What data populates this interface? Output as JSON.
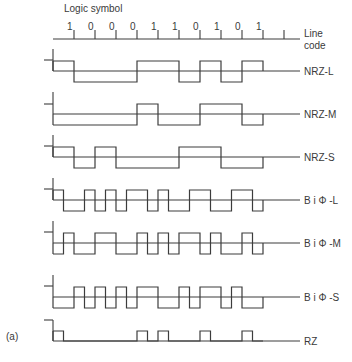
{
  "figure": {
    "header_label": "Logic symbol",
    "axis_label_line1": "Line",
    "axis_label_line2": "code",
    "panel_label": "(a)",
    "stroke_color": "#3c3c3c",
    "text_color": "#3a3a3a",
    "bits": [
      "1",
      "0",
      "0",
      "0",
      "1",
      "1",
      "0",
      "1",
      "0",
      "1"
    ],
    "x_start": 53,
    "bit_width": 21,
    "extra_tick": true
  },
  "waveforms": [
    {
      "name": "NRZ-L",
      "label": "NRZ-L",
      "base_y": 71,
      "high_y": 61,
      "low_y": 82,
      "axis_top": 49,
      "ref_tick_y": 60,
      "levels": [
        "H",
        "H",
        "L",
        "L",
        "L",
        "L",
        "L",
        "L",
        "H",
        "H",
        "H",
        "H",
        "L",
        "L",
        "H",
        "H",
        "L",
        "L",
        "H",
        "H"
      ]
    },
    {
      "name": "NRZ-M",
      "label": "NRZ-M",
      "base_y": 114,
      "high_y": 104,
      "low_y": 125,
      "axis_top": 92,
      "ref_tick_y": 104,
      "levels": [
        "L",
        "L",
        "L",
        "L",
        "L",
        "L",
        "L",
        "L",
        "H",
        "H",
        "L",
        "L",
        "L",
        "L",
        "H",
        "H",
        "H",
        "H",
        "L",
        "L"
      ]
    },
    {
      "name": "NRZ-S",
      "label": "NRZ-S",
      "base_y": 157,
      "high_y": 147,
      "low_y": 168,
      "axis_top": 135,
      "ref_tick_y": 146,
      "levels": [
        "H",
        "H",
        "L",
        "L",
        "H",
        "H",
        "L",
        "L",
        "L",
        "L",
        "L",
        "L",
        "H",
        "H",
        "H",
        "H",
        "L",
        "L",
        "L",
        "L"
      ]
    },
    {
      "name": "BiPhi-L",
      "label": "B i Φ -L",
      "base_y": 200,
      "high_y": 190,
      "low_y": 211,
      "axis_top": 178,
      "ref_tick_y": 189,
      "levels": [
        "H",
        "L",
        "L",
        "H",
        "L",
        "H",
        "L",
        "H",
        "H",
        "L",
        "H",
        "L",
        "L",
        "H",
        "H",
        "L",
        "L",
        "H",
        "H",
        "L"
      ]
    },
    {
      "name": "BiPhi-M",
      "label": "B i Φ -M",
      "base_y": 243,
      "high_y": 233,
      "low_y": 254,
      "axis_top": 221,
      "ref_tick_y": 232,
      "levels": [
        "L",
        "H",
        "L",
        "L",
        "H",
        "H",
        "L",
        "L",
        "H",
        "L",
        "H",
        "L",
        "H",
        "H",
        "L",
        "H",
        "L",
        "L",
        "H",
        "L"
      ]
    },
    {
      "name": "BiPhi-S",
      "label": "B i Φ -S",
      "base_y": 297,
      "high_y": 287,
      "low_y": 308,
      "axis_top": 275,
      "ref_tick_y": 286,
      "levels": [
        "L",
        "L",
        "H",
        "L",
        "H",
        "L",
        "H",
        "L",
        "H",
        "H",
        "L",
        "L",
        "H",
        "L",
        "H",
        "H",
        "L",
        "H",
        "L",
        "L"
      ]
    },
    {
      "name": "RZ",
      "label": "RZ",
      "base_y": 341,
      "high_y": 331,
      "low_y": 341,
      "axis_top": 320,
      "ref_tick_y": 320,
      "levels": [
        "H",
        "L",
        "L",
        "L",
        "L",
        "L",
        "L",
        "L",
        "H",
        "L",
        "H",
        "L",
        "L",
        "L",
        "H",
        "L",
        "L",
        "L",
        "H",
        "L"
      ]
    }
  ],
  "chart_data": {
    "type": "line",
    "xlabel": "Logic symbol",
    "ylabel": "Line code",
    "categories": [
      "1",
      "0",
      "0",
      "0",
      "1",
      "1",
      "0",
      "1",
      "0",
      "1"
    ],
    "series": [
      {
        "name": "NRZ-L",
        "half_bit_levels": [
          1,
          1,
          0,
          0,
          0,
          0,
          0,
          0,
          1,
          1,
          1,
          1,
          0,
          0,
          1,
          1,
          0,
          0,
          1,
          1
        ]
      },
      {
        "name": "NRZ-M",
        "half_bit_levels": [
          0,
          0,
          0,
          0,
          0,
          0,
          0,
          0,
          1,
          1,
          0,
          0,
          0,
          0,
          1,
          1,
          1,
          1,
          0,
          0
        ]
      },
      {
        "name": "NRZ-S",
        "half_bit_levels": [
          1,
          1,
          0,
          0,
          1,
          1,
          0,
          0,
          0,
          0,
          0,
          0,
          1,
          1,
          1,
          1,
          0,
          0,
          0,
          0
        ]
      },
      {
        "name": "BiΦ-L",
        "half_bit_levels": [
          1,
          0,
          0,
          1,
          0,
          1,
          0,
          1,
          1,
          0,
          1,
          0,
          0,
          1,
          1,
          0,
          0,
          1,
          1,
          0
        ]
      },
      {
        "name": "BiΦ-M",
        "half_bit_levels": [
          0,
          1,
          0,
          0,
          1,
          1,
          0,
          0,
          1,
          0,
          1,
          0,
          1,
          1,
          0,
          1,
          0,
          0,
          1,
          0
        ]
      },
      {
        "name": "BiΦ-S",
        "half_bit_levels": [
          0,
          0,
          1,
          0,
          1,
          0,
          1,
          0,
          1,
          1,
          0,
          0,
          1,
          0,
          1,
          1,
          0,
          1,
          0,
          0
        ]
      },
      {
        "name": "RZ",
        "half_bit_levels": [
          1,
          0,
          0,
          0,
          0,
          0,
          0,
          0,
          1,
          0,
          1,
          0,
          0,
          0,
          1,
          0,
          0,
          0,
          1,
          0
        ]
      }
    ],
    "grid": false,
    "legend_position": "right (labels at end of each trace)",
    "panel": "(a)"
  }
}
